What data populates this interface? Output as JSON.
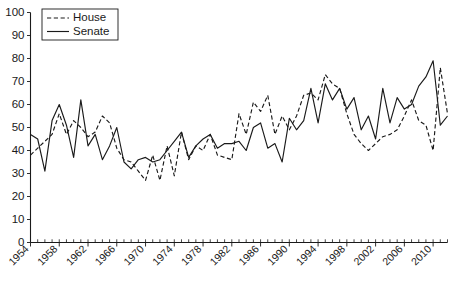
{
  "chart_data": {
    "type": "line",
    "title": "",
    "subtitle": "",
    "xlabel": "",
    "ylabel": "",
    "xlim": [
      1954,
      2012
    ],
    "ylim": [
      0,
      100
    ],
    "grid": false,
    "legend_position": "top-left",
    "y_ticks": [
      0,
      10,
      20,
      30,
      40,
      50,
      60,
      70,
      80,
      90,
      100
    ],
    "y_tick_labels": [
      "0",
      "10",
      "20",
      "30",
      "40",
      "50",
      "60",
      "70",
      "80",
      "90",
      "100"
    ],
    "x_ticks": [
      1954,
      1958,
      1962,
      1966,
      1970,
      1974,
      1978,
      1982,
      1986,
      1990,
      1994,
      1998,
      2002,
      2006,
      2010
    ],
    "x_tick_labels": [
      "1954",
      "1958",
      "1962",
      "1966",
      "1970",
      "1974",
      "1978",
      "1982",
      "1986",
      "1990",
      "1994",
      "1998",
      "2002",
      "2006",
      "2010"
    ],
    "x_minor_tick_step": 1,
    "x": [
      1954,
      1955,
      1956,
      1957,
      1958,
      1959,
      1960,
      1961,
      1962,
      1963,
      1964,
      1965,
      1966,
      1967,
      1968,
      1969,
      1970,
      1971,
      1972,
      1973,
      1974,
      1975,
      1976,
      1977,
      1978,
      1979,
      1980,
      1981,
      1982,
      1983,
      1984,
      1985,
      1986,
      1987,
      1988,
      1989,
      1990,
      1991,
      1992,
      1993,
      1994,
      1995,
      1996,
      1997,
      1998,
      1999,
      2000,
      2001,
      2002,
      2003,
      2004,
      2005,
      2006,
      2007,
      2008,
      2009,
      2010,
      2011,
      2012
    ],
    "series": [
      {
        "name": "House",
        "style": "dashed",
        "color": "#1a1a1a",
        "values": [
          38,
          41,
          44,
          47,
          56,
          47,
          53,
          50,
          46,
          48,
          55,
          52,
          41,
          36,
          35,
          31,
          27,
          38,
          27,
          42,
          29,
          48,
          36,
          42,
          40,
          47,
          38,
          37,
          36,
          56,
          47,
          61,
          57,
          64,
          47,
          55,
          49,
          55,
          64,
          65,
          62,
          73,
          69,
          67,
          56,
          47,
          43,
          40,
          43,
          46,
          47,
          49,
          55,
          62,
          53,
          51,
          40,
          76,
          56
        ]
      },
      {
        "name": "Senate",
        "style": "solid",
        "color": "#1a1a1a",
        "values": [
          47,
          45,
          31,
          53,
          60,
          51,
          37,
          62,
          42,
          47,
          36,
          42,
          50,
          35,
          32,
          36,
          37,
          35,
          36,
          40,
          44,
          48,
          37,
          42,
          45,
          47,
          41,
          43,
          43,
          44,
          40,
          50,
          52,
          41,
          43,
          35,
          54,
          49,
          53,
          67,
          52,
          69,
          62,
          67,
          58,
          63,
          49,
          55,
          45,
          67,
          52,
          63,
          58,
          60,
          68,
          72,
          79,
          51,
          55
        ]
      }
    ]
  },
  "legend": {
    "items": [
      {
        "label": "House",
        "style": "dashed"
      },
      {
        "label": "Senate",
        "style": "solid"
      }
    ]
  }
}
